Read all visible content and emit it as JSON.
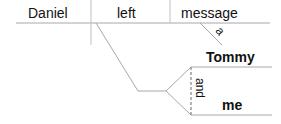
{
  "diagram": {
    "type": "sentence-diagram",
    "subject": "Daniel",
    "verb": "left",
    "direct_object": "message",
    "object_modifier": "a",
    "indirect_objects": [
      "Tommy",
      "me"
    ],
    "conjunction": "and"
  },
  "colors": {
    "line": "#a8a8a8",
    "text": "#111111",
    "background": "#ffffff"
  }
}
